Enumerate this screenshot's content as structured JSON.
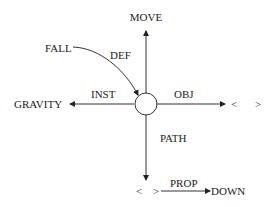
{
  "diagram": {
    "center_node": "",
    "nodes": {
      "top": "MOVE",
      "left": "GRAVITY",
      "right": "< >",
      "bottom": "< >",
      "bottom_right": "DOWN",
      "top_left": "FALL"
    },
    "edges": {
      "def": "DEF",
      "inst": "INST",
      "obj": "OBJ",
      "path": "PATH",
      "prop": "PROP"
    },
    "right_open": "<",
    "right_close": ">",
    "bottom_open": "<",
    "bottom_close": ">"
  }
}
